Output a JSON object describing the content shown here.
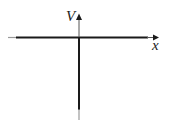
{
  "diagram": {
    "type": "coordinate-axes",
    "axes": {
      "vertical": {
        "label": "V",
        "arrow": "up"
      },
      "horizontal": {
        "label": "x",
        "arrow": "right"
      }
    },
    "colors": {
      "axis": "#1a1a1a",
      "axis_faded": "#9a9a9a",
      "label": "#222222",
      "background": "#ffffff"
    }
  }
}
